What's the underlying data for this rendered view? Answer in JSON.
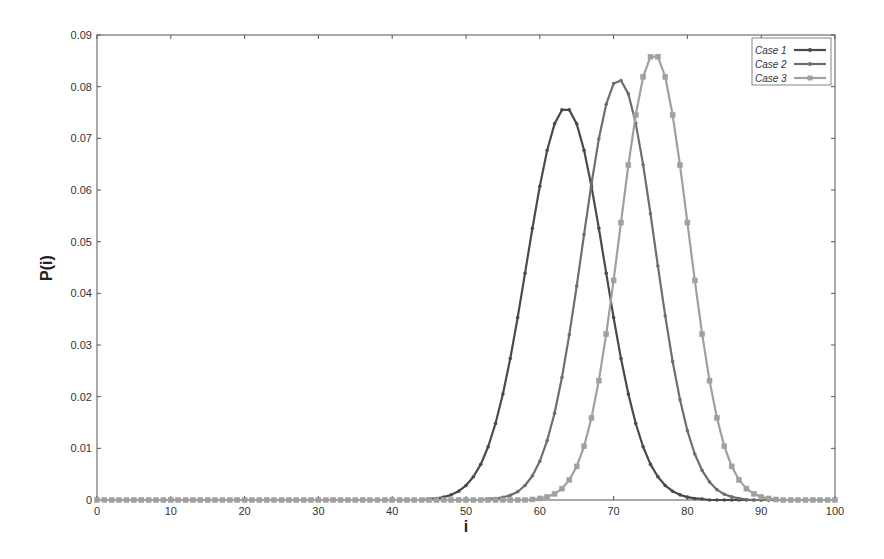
{
  "chart_data": {
    "type": "line",
    "title": "",
    "xlabel": "i",
    "ylabel": "P(i)",
    "xlim": [
      0,
      100
    ],
    "ylim": [
      0,
      0.09
    ],
    "xticks": [
      0,
      10,
      20,
      30,
      40,
      50,
      60,
      70,
      80,
      90,
      100
    ],
    "xtick_labels": [
      "0",
      "10",
      "20",
      "30",
      "40",
      "50",
      "60",
      "70",
      "80",
      "90",
      "100"
    ],
    "yticks": [
      0,
      0.01,
      0.02,
      0.03,
      0.04,
      0.05,
      0.06,
      0.07,
      0.08,
      0.09
    ],
    "ytick_labels": [
      "0",
      "0.01",
      "0.02",
      "0.03",
      "0.04",
      "0.05",
      "0.06",
      "0.07",
      "0.08",
      "0.09"
    ],
    "grid": false,
    "legend_position": "upper right",
    "x_start": 0,
    "x_step": 1,
    "series": [
      {
        "name": "Case 1",
        "color": "#4a4a4a",
        "marker": "dot",
        "peak": {
          "x": 63.5,
          "y": 0.0758
        },
        "values": [
          0,
          0,
          0,
          0,
          0,
          0,
          0,
          0,
          0,
          0,
          0,
          0,
          0,
          0,
          0,
          0,
          0,
          0,
          0,
          0,
          0,
          0,
          0,
          0,
          0,
          0,
          0,
          0,
          0,
          0,
          0,
          0,
          0,
          0,
          0,
          0,
          0,
          0,
          0,
          0,
          0,
          0,
          0,
          0,
          0,
          0.0002,
          0.0003,
          0.00055,
          0.001,
          0.0017,
          0.0028,
          0.0045,
          0.0069,
          0.0103,
          0.0148,
          0.0205,
          0.0274,
          0.0353,
          0.0439,
          0.0526,
          0.0607,
          0.0677,
          0.0728,
          0.0755,
          0.0755,
          0.0728,
          0.0677,
          0.0607,
          0.0526,
          0.0439,
          0.0353,
          0.0274,
          0.0205,
          0.0148,
          0.0103,
          0.0069,
          0.0045,
          0.0028,
          0.0017,
          0.001,
          0.00055,
          0.0003,
          0.0002,
          0,
          0,
          0,
          0,
          0,
          0,
          0,
          0,
          0,
          0,
          0,
          0,
          0,
          0,
          0,
          0,
          0,
          0
        ]
      },
      {
        "name": "Case 2",
        "color": "#6e6e6e",
        "marker": "dot",
        "peak": {
          "x": 71,
          "y": 0.0812
        },
        "values": [
          0,
          0,
          0,
          0,
          0,
          0,
          0,
          0,
          0,
          0,
          0,
          0,
          0,
          0,
          0,
          0,
          0,
          0,
          0,
          0,
          0,
          0,
          0,
          0,
          0,
          0,
          0,
          0,
          0,
          0,
          0,
          0,
          0,
          0,
          0,
          0,
          0,
          0,
          0,
          0,
          0,
          0,
          0,
          0,
          0,
          0,
          0,
          0,
          0,
          0,
          0,
          0,
          0,
          0.0002,
          0.0003,
          0.0005,
          0.0009,
          0.0016,
          0.0028,
          0.0047,
          0.0075,
          0.0115,
          0.0168,
          0.0237,
          0.032,
          0.0414,
          0.0514,
          0.0612,
          0.0699,
          0.0766,
          0.0806,
          0.0812,
          0.0786,
          0.0729,
          0.0649,
          0.0554,
          0.0453,
          0.0356,
          0.0268,
          0.0194,
          0.0134,
          0.0089,
          0.0057,
          0.0035,
          0.002,
          0.0011,
          0.0006,
          0.0003,
          0.0001,
          0,
          0,
          0,
          0,
          0,
          0,
          0,
          0,
          0,
          0,
          0,
          0
        ]
      },
      {
        "name": "Case 3",
        "color": "#a0a0a0",
        "marker": "square",
        "peak": {
          "x": 75.5,
          "y": 0.0858
        },
        "values": [
          0,
          0,
          0,
          0,
          0,
          0,
          0,
          0,
          0,
          0,
          0,
          0,
          0,
          0,
          0,
          0,
          0,
          0,
          0,
          0,
          0,
          0,
          0,
          0,
          0,
          0,
          0,
          0,
          0,
          0,
          0,
          0,
          0,
          0,
          0,
          0,
          0,
          0,
          0,
          0,
          0,
          0,
          0,
          0,
          0,
          0,
          0,
          0,
          0,
          0,
          0,
          0,
          0,
          0,
          0,
          0,
          0,
          0,
          0,
          0.0001,
          0.0003,
          0.0006,
          0.0012,
          0.0022,
          0.0039,
          0.0065,
          0.0104,
          0.0159,
          0.0231,
          0.0321,
          0.0425,
          0.0537,
          0.0648,
          0.0745,
          0.0819,
          0.0858,
          0.0858,
          0.0819,
          0.0745,
          0.0648,
          0.0537,
          0.0425,
          0.0321,
          0.0231,
          0.0159,
          0.0104,
          0.0065,
          0.0039,
          0.0022,
          0.0012,
          0.0006,
          0.0003,
          0.0001,
          0,
          0,
          0,
          0,
          0,
          0,
          0,
          0
        ]
      }
    ]
  }
}
